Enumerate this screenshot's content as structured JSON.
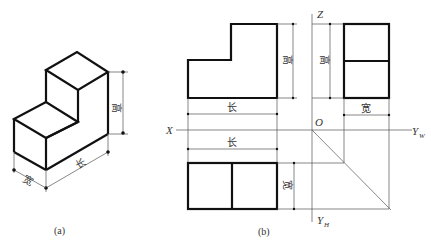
{
  "figure_a": {
    "caption": "(a)",
    "dims": {
      "height": "高",
      "length": "长",
      "width": "宽"
    }
  },
  "figure_b": {
    "caption": "(b)",
    "front_view": {
      "length": "长",
      "height": "高"
    },
    "side_view": {
      "height": "高",
      "width": "宽"
    },
    "top_view": {
      "length": "长",
      "width": "宽"
    },
    "axes": {
      "x": "X",
      "z": "Z",
      "origin": "O",
      "yw": "Y",
      "yw_sub": "W",
      "yh": "Y",
      "yh_sub": "H"
    }
  },
  "colors": {
    "line": "#111111",
    "thin": "#555555",
    "background": "#ffffff"
  }
}
